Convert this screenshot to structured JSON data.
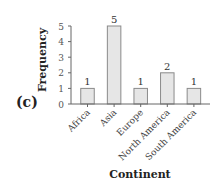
{
  "panel_label": "(c)",
  "chart_data": {
    "type": "bar",
    "title": "",
    "xlabel": "Continent",
    "ylabel": "Frequency",
    "categories": [
      "Africa",
      "Asia",
      "Europe",
      "North America",
      "South America"
    ],
    "values": [
      1,
      5,
      1,
      2,
      1
    ],
    "data_labels": [
      "1",
      "5",
      "1",
      "2",
      "1"
    ],
    "ylim": [
      0,
      5
    ],
    "yticks": [
      0,
      1,
      2,
      3,
      4,
      5
    ],
    "grid": false,
    "legend": null,
    "bar_color": "#e6e6e6",
    "bar_edge_color": "#8a8a8a"
  }
}
